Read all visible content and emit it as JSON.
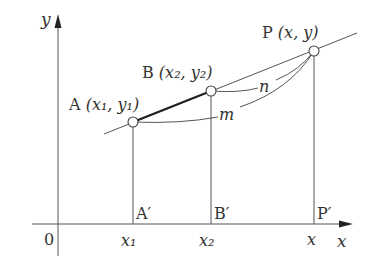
{
  "colors": {
    "line": "#555555",
    "thick": "#222222",
    "text": "#333333",
    "point_fill": "#ffffff"
  },
  "axes": {
    "x_label": "x",
    "y_label": "y",
    "origin_label": "0"
  },
  "points": {
    "A": {
      "name": "A",
      "coords": "(x₁, y₁)"
    },
    "B": {
      "name": "B",
      "coords": "(x₂, y₂)"
    },
    "P": {
      "name": "P",
      "coords": "(x, y)"
    }
  },
  "projections": {
    "A_prime": "A′",
    "B_prime": "B′",
    "P_prime": "P′"
  },
  "x_ticks": {
    "x1": "x₁",
    "x2": "x₂",
    "x": "x"
  },
  "curves": {
    "n": "n",
    "m": "m"
  }
}
